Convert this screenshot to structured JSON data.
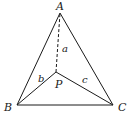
{
  "diagram": {
    "type": "geometry",
    "stroke_color": "#1a1a1a",
    "vertices": [
      {
        "id": "A",
        "label": "A",
        "x": 60,
        "y": 13
      },
      {
        "id": "B",
        "label": "B",
        "x": 17,
        "y": 105
      },
      {
        "id": "C",
        "label": "C",
        "x": 113,
        "y": 105
      },
      {
        "id": "P",
        "label": "P",
        "x": 56,
        "y": 72
      }
    ],
    "edges": [
      {
        "from": "A",
        "to": "B",
        "style": "solid"
      },
      {
        "from": "B",
        "to": "C",
        "style": "solid"
      },
      {
        "from": "C",
        "to": "A",
        "style": "solid"
      },
      {
        "from": "P",
        "to": "A",
        "style": "dashed",
        "label": "a"
      },
      {
        "from": "P",
        "to": "B",
        "style": "solid",
        "label": "b"
      },
      {
        "from": "P",
        "to": "C",
        "style": "solid",
        "label": "c"
      }
    ],
    "labels": {
      "A": "A",
      "B": "B",
      "C": "C",
      "P": "P",
      "a": "a",
      "b": "b",
      "c": "c"
    }
  }
}
